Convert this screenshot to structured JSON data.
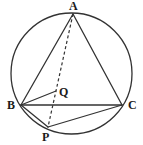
{
  "figure": {
    "type": "euclidean-geometry-diagram",
    "background_color": "#ffffff",
    "stroke_color": "#333333",
    "label_color": "#1a1a1a",
    "canvas": {
      "width": 143,
      "height": 145
    }
  },
  "circle": {
    "name": "circumcircle",
    "center_x": 71.5,
    "center_y": 73.5,
    "radius": 60.5,
    "stroke_width": 1.3,
    "dashed": false
  },
  "points": [
    {
      "id": "A",
      "label": "A",
      "x": 73,
      "y": 14,
      "label_x": 69,
      "label_y": 0
    },
    {
      "id": "B",
      "label": "B",
      "x": 21,
      "y": 105,
      "label_x": 7,
      "label_y": 99
    },
    {
      "id": "C",
      "label": "C",
      "x": 122,
      "y": 105,
      "label_x": 128,
      "label_y": 99
    },
    {
      "id": "P",
      "label": "P",
      "x": 48,
      "y": 127,
      "label_x": 42,
      "label_y": 131
    },
    {
      "id": "Q",
      "label": "Q",
      "x": 56,
      "y": 91,
      "label_x": 59,
      "label_y": 86
    }
  ],
  "segments": [
    {
      "id": "AB",
      "from": "A",
      "to": "B",
      "dashed": false,
      "stroke_width": 1.3
    },
    {
      "id": "AC",
      "from": "A",
      "to": "C",
      "dashed": false,
      "stroke_width": 1.3
    },
    {
      "id": "BC",
      "from": "B",
      "to": "C",
      "dashed": false,
      "stroke_width": 1.3
    },
    {
      "id": "BQ",
      "from": "B",
      "to": "Q",
      "dashed": false,
      "stroke_width": 1.3
    },
    {
      "id": "BP",
      "from": "B",
      "to": "P",
      "dashed": false,
      "stroke_width": 1.3
    },
    {
      "id": "PC",
      "from": "P",
      "to": "C",
      "dashed": false,
      "stroke_width": 1.3
    },
    {
      "id": "AP",
      "from": "A",
      "to": "P",
      "dashed": true,
      "stroke_width": 1.2,
      "dash_pattern": "3,2.5"
    }
  ]
}
